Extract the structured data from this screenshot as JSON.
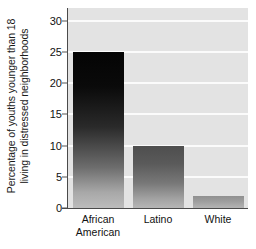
{
  "chart_data": {
    "type": "bar",
    "title": "",
    "subtitle": "",
    "xlabel": "",
    "ylabel": "Percentage of youths younger than 18 living in distressed neighborhoods",
    "ylabel_lines": [
      "Percentage of youths younger than 18",
      "living in distressed neighborhoods"
    ],
    "categories": [
      "African American",
      "Latino",
      "White"
    ],
    "category_lines": [
      [
        "African",
        "American"
      ],
      [
        "Latino"
      ],
      [
        "White"
      ]
    ],
    "values": [
      25,
      10,
      2
    ],
    "ylim": [
      0,
      32
    ],
    "yticks": [
      0,
      5,
      10,
      15,
      20,
      25,
      30
    ],
    "ytick_labels": [
      "0",
      "5",
      "10",
      "15",
      "20",
      "25",
      "30"
    ],
    "grid": true,
    "grid_orientation": "horizontal",
    "legend": "none",
    "bar_style": "vertical-gradient-grayscale",
    "colors": {
      "plot_background": "#e3e3e3",
      "gridline": "#fbfbfb",
      "axis": "#4a4a4a",
      "text": "#111111",
      "bar_african_american_top": "#040404",
      "bar_african_american_bottom": "#bcbcbc",
      "bar_latino_top": "#4e4e4e",
      "bar_latino_bottom": "#b6b6b6",
      "bar_white_top": "#909090",
      "bar_white_bottom": "#b4b4b4"
    }
  }
}
